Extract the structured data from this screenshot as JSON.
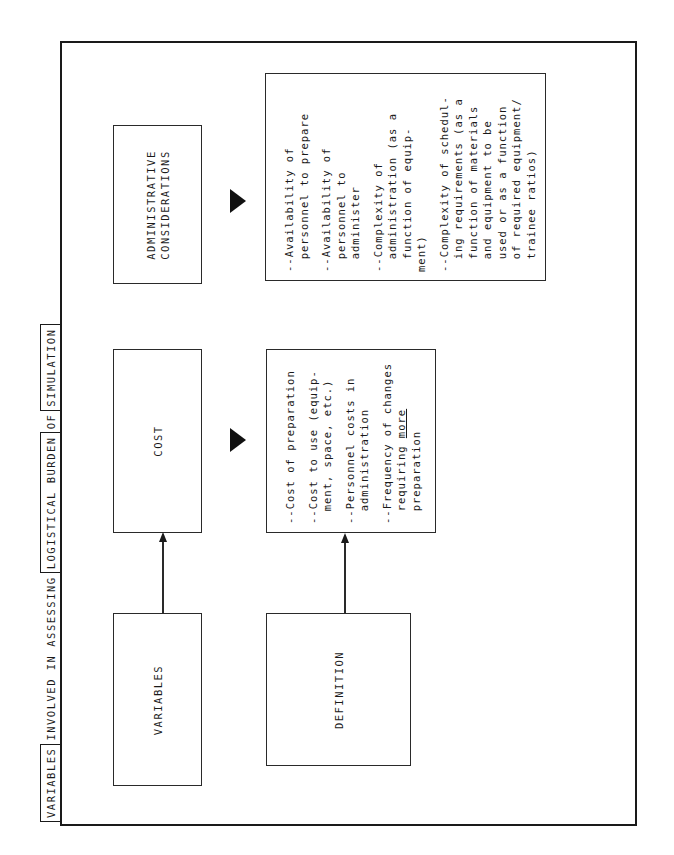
{
  "title": {
    "segments": [
      {
        "text": "VARIABLES",
        "boxed": true
      },
      {
        "text": "INVOLVED IN ASSESSING",
        "boxed": false
      },
      {
        "text": "LOGISTICAL BURDEN",
        "boxed": true
      },
      {
        "text": "OF",
        "boxed": false
      },
      {
        "text": "SIMULATION",
        "boxed": true
      }
    ]
  },
  "row_headers": {
    "variables": "VARIABLES",
    "definition": "DEFINITION"
  },
  "columns": [
    {
      "heading": "COST",
      "definition_items": [
        {
          "lines": [
            "--Cost of preparation"
          ]
        },
        {
          "lines": [
            "--Cost to use (equip-",
            "ment, space, etc.)"
          ]
        },
        {
          "lines": [
            "--Personnel costs in",
            "administration"
          ]
        },
        {
          "lines": [
            "--Frequency of changes",
            "requiring more",
            "preparation"
          ],
          "underlined_word": "more"
        }
      ]
    },
    {
      "heading_line1": "ADMINISTRATIVE",
      "heading_line2": "CONSIDERATIONS",
      "definition_items": [
        {
          "lines": [
            "--Availability of",
            "personnel to prepare"
          ]
        },
        {
          "lines": [
            "--Availability of",
            "personnel to",
            "administer"
          ]
        },
        {
          "lines": [
            "--Complexity of",
            "administration (as a",
            "function of equip-",
            "ment)"
          ]
        },
        {
          "lines": [
            "--Complexity of schedul-",
            "ing requirements (as a",
            "function of materials",
            "and equipment to be",
            "used or as a function",
            "of required equipment/",
            "trainee ratios)"
          ]
        }
      ]
    }
  ],
  "colors": {
    "line": "#1a1a1a",
    "background": "#ffffff"
  }
}
